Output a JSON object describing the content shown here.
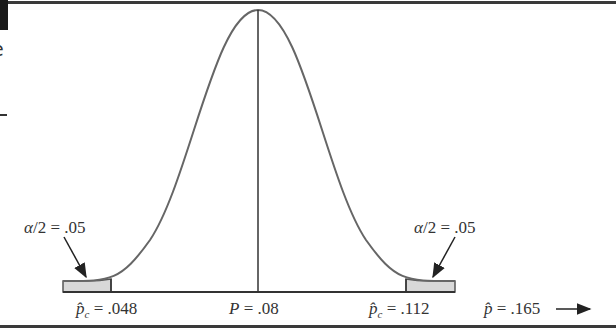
{
  "diagram": {
    "type": "normal-distribution-two-tailed-test",
    "center_label": "P = .08",
    "lower_critical_label": "p̂c = .048",
    "upper_critical_label": "p̂c = .112",
    "sample_label": "p̂ = .165",
    "left_tail_label": "α/2 = .05",
    "right_tail_label": "α/2 = .05",
    "colors": {
      "curve": "#555555",
      "shade": "#d8d8d8",
      "line": "#333333"
    }
  },
  "labels": {
    "left_tail": {
      "greek": "α",
      "rest": "/2 = .05"
    },
    "right_tail": {
      "greek": "α",
      "rest": "/2 = .05"
    },
    "lower": {
      "var": "p̂",
      "sub": "c",
      "rest": " = .048"
    },
    "center": {
      "var": "P",
      "rest": " = .08"
    },
    "upper": {
      "var": "p̂",
      "sub": "c",
      "rest": " = .112"
    },
    "sample": {
      "var": "p̂",
      "rest": " = .165"
    }
  },
  "edge": {
    "char": "e"
  }
}
